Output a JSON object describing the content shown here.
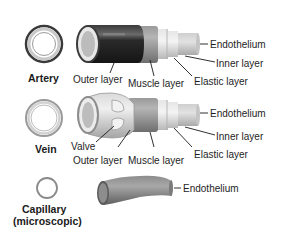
{
  "diagram": {
    "type": "anatomy-blood-vessels",
    "vessels": [
      {
        "id": "artery",
        "name": "Artery",
        "labels": {
          "outer": "Outer layer",
          "muscle": "Muscle layer",
          "elastic": "Elastic layer",
          "inner": "Inner layer",
          "endothelium": "Endothelium"
        }
      },
      {
        "id": "vein",
        "name": "Vein",
        "labels": {
          "valve": "Valve",
          "outer": "Outer layer",
          "muscle": "Muscle layer",
          "elastic": "Elastic layer",
          "inner": "Inner layer",
          "endothelium": "Endothelium"
        }
      },
      {
        "id": "capillary",
        "name_line1": "Capillary",
        "name_line2": "(microscopic)",
        "labels": {
          "endothelium": "Endothelium"
        }
      }
    ],
    "colors": {
      "outer_dark": "#2b2b2b",
      "muscle": "#8a8a8a",
      "light_layer": "#d8d8d8",
      "endothelium": "#bdbdbd",
      "line": "#1a1a1a"
    }
  }
}
